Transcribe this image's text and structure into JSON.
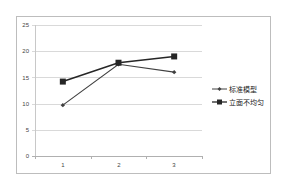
{
  "chart_data": {
    "type": "line",
    "title": "",
    "xlabel": "",
    "ylabel": "",
    "categories": [
      "1",
      "2",
      "3"
    ],
    "ylim": [
      0,
      25
    ],
    "yticks": [
      0,
      5,
      10,
      15,
      20,
      25
    ],
    "grid": true,
    "legend_position": "right",
    "series": [
      {
        "name": "标准模型",
        "marker": "diamond",
        "color": "#404040",
        "values": [
          9.7,
          17.5,
          16.0
        ]
      },
      {
        "name": "立面不均匀",
        "marker": "square",
        "color": "#262626",
        "values": [
          14.2,
          17.8,
          19.0
        ]
      }
    ]
  },
  "axis": {
    "y_labels": [
      "0",
      "5",
      "10",
      "15",
      "20",
      "25"
    ],
    "x_labels": [
      "1",
      "2",
      "3"
    ]
  },
  "legend": {
    "items": [
      {
        "label": "标准模型"
      },
      {
        "label": "立面不均匀"
      }
    ]
  }
}
